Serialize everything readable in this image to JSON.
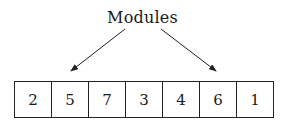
{
  "diagram": {
    "label": "Modules",
    "cells": [
      "2",
      "5",
      "7",
      "3",
      "4",
      "6",
      "1"
    ],
    "arrows": [
      {
        "from": "Modules",
        "to_cell_index": 1
      },
      {
        "from": "Modules",
        "to_cell_index": 5
      }
    ]
  }
}
